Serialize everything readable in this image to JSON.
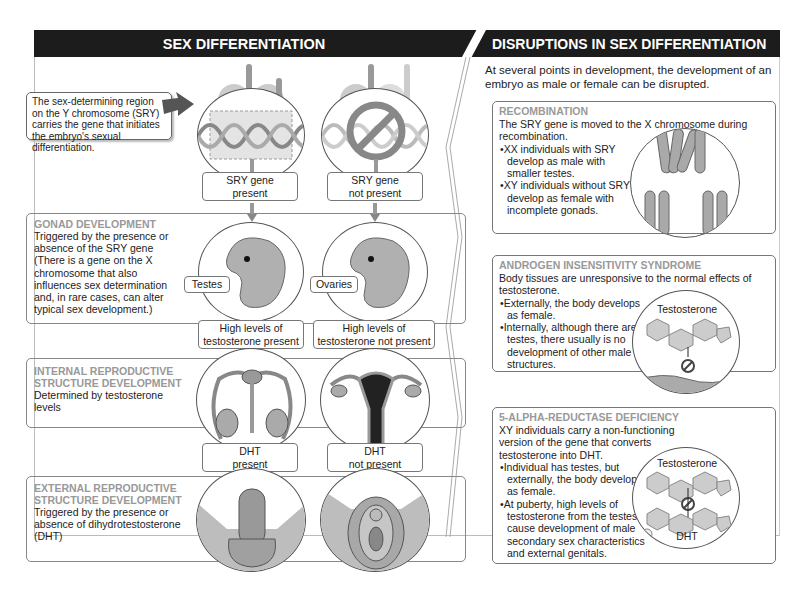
{
  "headers": {
    "left": "SEX DIFFERENTIATION",
    "right": "DISRUPTIONS IN SEX DIFFERENTIATION"
  },
  "callout": {
    "text": "The sex-determining region on the Y chromosome (SRY) carries the gene that initiates the embryo's sexual differentiation."
  },
  "chromosomes": {
    "male": [
      "X",
      "Y"
    ],
    "female": [
      "X",
      "X"
    ]
  },
  "labels": {
    "sry_present": [
      "SRY gene",
      "present"
    ],
    "sry_absent": [
      "SRY gene",
      "not present"
    ],
    "testes": "Testes",
    "ovaries": "Ovaries",
    "testo_present": [
      "High levels of",
      "testosterone present"
    ],
    "testo_absent": [
      "High levels of",
      "testosterone not present"
    ],
    "dht_present": [
      "DHT",
      "present"
    ],
    "dht_absent": [
      "DHT",
      "not present"
    ]
  },
  "stages": [
    {
      "title": "GONAD DEVELOPMENT",
      "text": "Triggered by the presence or absence of the SRY gene (There is a gene on the X chromosome that also influences sex determination and, in rare cases, can alter typical sex development.)"
    },
    {
      "title": "INTERNAL REPRODUCTIVE STRUCTURE DEVELOPMENT",
      "text": "Determined by testosterone levels"
    },
    {
      "title": "EXTERNAL REPRODUCTIVE STRUCTURE DEVELOPMENT",
      "text": "Triggered by the presence or absence of dihydrotestosterone (DHT)"
    }
  ],
  "disruptions": {
    "intro": "At several points in development, the development of an embryo as male or female can be disrupted.",
    "items": [
      {
        "title": "RECOMBINATION",
        "text": "The SRY gene is moved to the X chromosome during recombination.",
        "bullets": [
          "XX individuals with SRY develop as male with smaller testes.",
          "XY individuals without SRY develop as female with incomplete gonads."
        ]
      },
      {
        "title": "ANDROGEN INSENSITIVITY SYNDROME",
        "text": "Body tissues are unresponsive to the normal effects of testosterone.",
        "bullets": [
          "Externally, the body develops as female.",
          "Internally, although there are testes, there usually is no development of other male structures."
        ],
        "figure_label": "Testosterone"
      },
      {
        "title": "5-ALPHA-REDUCTASE DEFICIENCY",
        "text": "XY individuals carry a non-functioning version of the gene that converts testosterone into DHT.",
        "bullets": [
          "Individual has testes, but externally, the body develops as female.",
          "At puberty, high levels of testosterone from the testes cause development of male secondary sex characteristics and external genitals."
        ],
        "figure_labels": [
          "Testosterone",
          "DHT"
        ]
      }
    ]
  },
  "colors": {
    "header_bg": "#1c1c1c",
    "title_gray": "#999999",
    "fill_gray": "#b5b5b5"
  }
}
